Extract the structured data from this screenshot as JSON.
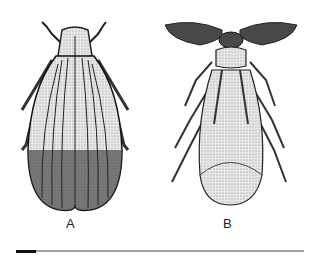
{
  "figure": {
    "panels": [
      {
        "label": "A",
        "subject": "beetle-illustration",
        "description": "Elongated beetle with ribbed, striated elytra, dorsal view"
      },
      {
        "label": "B",
        "subject": "winged-insect-illustration",
        "description": "Male insect with large plumose antennae and folded wings, dorsal view"
      }
    ],
    "scale_bar": {
      "present": true
    }
  },
  "colors": {
    "ink": "#1a1a1a",
    "background": "#ffffff"
  }
}
